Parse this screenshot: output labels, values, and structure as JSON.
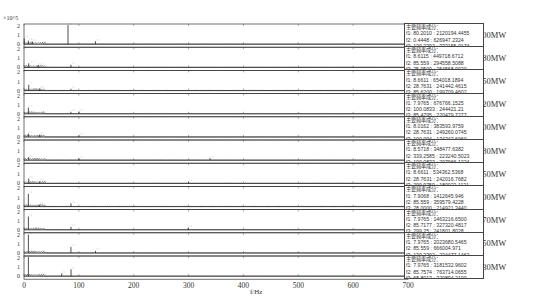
{
  "chart_data": {
    "type": "line",
    "title": "",
    "xlabel": "f/Hz",
    "ylabel": "",
    "y_scale_label": "×10^5",
    "xlim": [
      0,
      700
    ],
    "ylim": [
      0,
      2
    ],
    "x_ticks": [
      0,
      100,
      200,
      300,
      400,
      500,
      600,
      700
    ],
    "y_ticks": [
      0,
      1,
      2
    ],
    "grid": false,
    "panels": [
      {
        "label": "700MW",
        "components_title": "主要频率成分：",
        "components": [
          "f1: 80.2010 : 2120194.4455",
          "f2: 0.4448 : 626947.2324",
          "f3: 130.2392 : 333155.0174"
        ],
        "peaks": [
          {
            "f": 80.2,
            "a": 2.1
          },
          {
            "f": 0.44,
            "a": 0.63
          },
          {
            "f": 130.2,
            "a": 0.33
          },
          {
            "f": 8,
            "a": 0.4
          },
          {
            "f": 15,
            "a": 0.3
          }
        ]
      },
      {
        "label": "680MW",
        "components_title": "主要频率成分：",
        "components": [
          "f1: 8.6115 : 449718.6712",
          "f2: 85.559 : 294558.5088",
          "f3: 25.9500 : 254568.9920"
        ],
        "peaks": [
          {
            "f": 8.61,
            "a": 0.45
          },
          {
            "f": 85.56,
            "a": 0.29
          },
          {
            "f": 25.95,
            "a": 0.25
          }
        ]
      },
      {
        "label": "650MW",
        "components_title": "主要频率成分：",
        "components": [
          "f1: 8.6611 : 654018.1894",
          "f2: 28.7631 : 241442.4615",
          "f3: 85.6200 : 199709.4602"
        ],
        "peaks": [
          {
            "f": 8.66,
            "a": 0.65
          },
          {
            "f": 28.76,
            "a": 0.24
          },
          {
            "f": 85.62,
            "a": 0.2
          }
        ]
      },
      {
        "label": "620MW",
        "components_title": "主要频率成分：",
        "components": [
          "f1: 7.9765 : 676766.1525",
          "f2: 100.0833 : 244421.21",
          "f3: 85.4795 : 220479.7277"
        ],
        "peaks": [
          {
            "f": 7.98,
            "a": 0.68
          },
          {
            "f": 100.08,
            "a": 0.24
          },
          {
            "f": 85.48,
            "a": 0.22
          }
        ]
      },
      {
        "label": "600MW",
        "components_title": "主要频率成分：",
        "components": [
          "f1: 8.0162 : 383593.9759",
          "f2: 28.7631 : 249260.0745",
          "f3: 100.094 : 174343.6960"
        ],
        "peaks": [
          {
            "f": 8.02,
            "a": 0.38
          },
          {
            "f": 28.76,
            "a": 0.25
          },
          {
            "f": 100.09,
            "a": 0.17
          }
        ]
      },
      {
        "label": "580MW",
        "components_title": "主要频率成分：",
        "components": [
          "f1: 8.5718 : 348477.6382",
          "f2: 339.2585 : 223240.5023",
          "f3: 100.0833 : 207966.1224"
        ],
        "peaks": [
          {
            "f": 8.57,
            "a": 0.35
          },
          {
            "f": 339.26,
            "a": 0.22
          },
          {
            "f": 100.08,
            "a": 0.21
          }
        ]
      },
      {
        "label": "550MW",
        "components_title": "主要频率成分：",
        "components": [
          "f1: 8.6611 : 534362.5368",
          "f2: 28.7631 : 242016.7682",
          "f3: 299.9759 : 180022.1121"
        ],
        "peaks": [
          {
            "f": 8.66,
            "a": 0.53
          },
          {
            "f": 28.76,
            "a": 0.24
          },
          {
            "f": 299.98,
            "a": 0.18
          }
        ]
      },
      {
        "label": "500MW",
        "components_title": "主要频率成分：",
        "components": [
          "f1: 7.9068 : 1412645.946",
          "f2: 85.559 : 359579.4228",
          "f3: 28.0000 : 214921.3440"
        ],
        "peaks": [
          {
            "f": 7.91,
            "a": 1.41
          },
          {
            "f": 85.56,
            "a": 0.36
          },
          {
            "f": 28.0,
            "a": 0.21
          }
        ]
      },
      {
        "label": "470MW",
        "components_title": "主要频率成分：",
        "components": [
          "f1: 7.9765 : 1463216.6500",
          "f2: 85.7177 : 327320.4817",
          "f3: 299.25 : 241801.8028"
        ],
        "peaks": [
          {
            "f": 7.98,
            "a": 1.46
          },
          {
            "f": 85.72,
            "a": 0.33
          },
          {
            "f": 299.25,
            "a": 0.24
          }
        ]
      },
      {
        "label": "450MW",
        "components_title": "主要频率成分：",
        "components": [
          "f1: 7.9765 : 2023680.5465",
          "f2: 85.559 : 666004.971",
          "f3: 130.2392 : 234477.1462"
        ],
        "peaks": [
          {
            "f": 7.98,
            "a": 2.02
          },
          {
            "f": 85.56,
            "a": 0.67
          },
          {
            "f": 130.24,
            "a": 0.23
          }
        ]
      },
      {
        "label": "430MW",
        "components_title": "主要频率成分：",
        "components": [
          "f1: 7.9765 : 3181532.9602",
          "f2: 85.7574 : 763714.0655",
          "f3: 68.8013 : 320894.2100"
        ],
        "peaks": [
          {
            "f": 7.98,
            "a": 3.18
          },
          {
            "f": 85.76,
            "a": 0.76
          },
          {
            "f": 68.8,
            "a": 0.32
          }
        ]
      }
    ]
  }
}
